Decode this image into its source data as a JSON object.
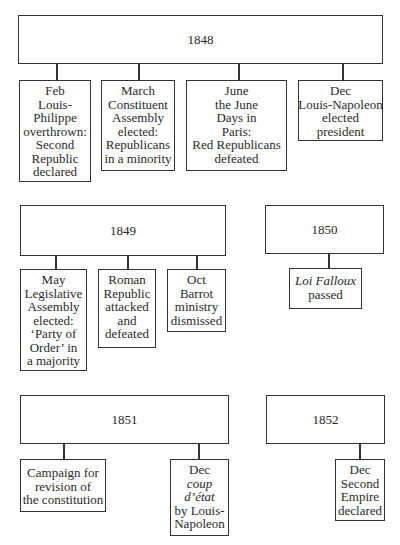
{
  "years": [
    {
      "year": "1848",
      "events": [
        {
          "lines": [
            "Feb",
            "Louis-",
            "Philippe",
            "overthrown:",
            "Second",
            "Republic",
            "declared"
          ]
        },
        {
          "lines": [
            "March",
            "Constituent",
            "Assembly",
            "elected:",
            "Republicans",
            "in a minority"
          ]
        },
        {
          "lines": [
            "June",
            "the June",
            "Days in",
            "Paris:",
            "Red Republicans",
            "defeated"
          ]
        },
        {
          "lines": [
            "Dec",
            "Louis-Napoleon",
            "elected",
            "president"
          ]
        }
      ]
    },
    {
      "year": "1849",
      "events": [
        {
          "lines": [
            "May",
            "Legislative",
            "Assembly",
            "elected:",
            "‘Party of",
            "Order’ in",
            "a majority"
          ]
        },
        {
          "lines": [
            "Roman",
            "Republic",
            "attacked",
            "and",
            "defeated"
          ]
        },
        {
          "lines": [
            "Oct",
            "Barrot",
            "ministry",
            "dismissed"
          ]
        }
      ]
    },
    {
      "year": "1850",
      "events": [
        {
          "lines": [
            "Loi Falloux",
            "passed"
          ],
          "italic_lines": [
            0
          ]
        }
      ]
    },
    {
      "year": "1851",
      "events": [
        {
          "lines": [
            "Campaign for",
            "revision of",
            "the constitution"
          ]
        },
        {
          "lines": [
            "Dec",
            "coup",
            "d’état",
            "by Louis-",
            "Napoleon"
          ],
          "italic_lines": [
            1,
            2
          ]
        }
      ]
    },
    {
      "year": "1852",
      "events": [
        {
          "lines": [
            "Dec",
            "Second",
            "Empire",
            "declared"
          ]
        }
      ]
    }
  ]
}
